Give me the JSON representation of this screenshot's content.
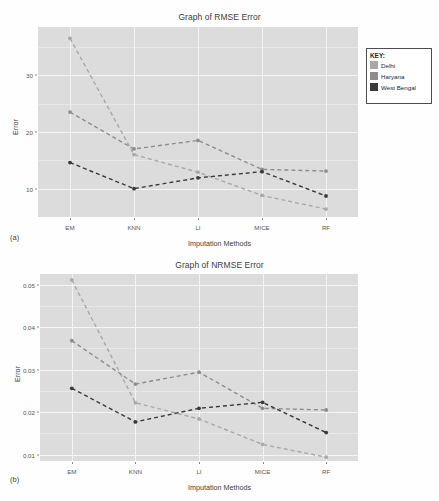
{
  "figure": {
    "subcaptions": {
      "a": "(a)",
      "b": "(b)"
    }
  },
  "legend": {
    "title": "KEY:",
    "entries": [
      {
        "label": "Delhi",
        "color": "#a8a8a8"
      },
      {
        "label": "Haryana",
        "color": "#8d8d8d"
      },
      {
        "label": "West Bengal",
        "color": "#3a3a3a"
      }
    ]
  },
  "chart_data": [
    {
      "id": "rmse",
      "type": "line",
      "title": "Graph of RMSE Error",
      "xlabel": "Imputation Methods",
      "ylabel": "Error",
      "categories": [
        "EM",
        "KNN",
        "LI",
        "MICE",
        "RF"
      ],
      "yticks": [
        10,
        20,
        30
      ],
      "ytick_labels": [
        "10",
        "20",
        "30"
      ],
      "ylim": [
        5.0,
        38.5
      ],
      "grid": true,
      "legend_position": "right-outside",
      "linestyle": "dashed",
      "markers": true,
      "series": [
        {
          "name": "Delhi",
          "color": "#a8a8a8",
          "values": [
            36.5,
            16.0,
            12.9,
            8.8,
            6.4
          ]
        },
        {
          "name": "Haryana",
          "color": "#8d8d8d",
          "values": [
            23.5,
            17.0,
            18.5,
            13.4,
            13.1
          ]
        },
        {
          "name": "West Bengal",
          "color": "#3a3a3a",
          "values": [
            14.6,
            10.0,
            11.9,
            13.0,
            8.7
          ]
        }
      ]
    },
    {
      "id": "nrmse",
      "type": "line",
      "title": "Graph of NRMSE Error",
      "xlabel": "Imputation Methods",
      "ylabel": "Error",
      "categories": [
        "EM",
        "KNN",
        "LI",
        "MICE",
        "RF"
      ],
      "yticks": [
        0.01,
        0.02,
        0.03,
        0.04,
        0.05
      ],
      "ytick_labels": [
        "0.01",
        "0.02",
        "0.03",
        "0.04",
        "0.05"
      ],
      "ylim": [
        0.0085,
        0.0525
      ],
      "grid": true,
      "legend_position": "right-outside",
      "linestyle": "dashed",
      "markers": true,
      "series": [
        {
          "name": "Delhi",
          "color": "#a8a8a8",
          "values": [
            0.0511,
            0.0222,
            0.0184,
            0.0124,
            0.0094
          ]
        },
        {
          "name": "Haryana",
          "color": "#8d8d8d",
          "values": [
            0.0368,
            0.0266,
            0.0294,
            0.0209,
            0.0205
          ]
        },
        {
          "name": "West Bengal",
          "color": "#3a3a3a",
          "values": [
            0.0256,
            0.0177,
            0.0209,
            0.0223,
            0.0152
          ]
        }
      ]
    }
  ]
}
